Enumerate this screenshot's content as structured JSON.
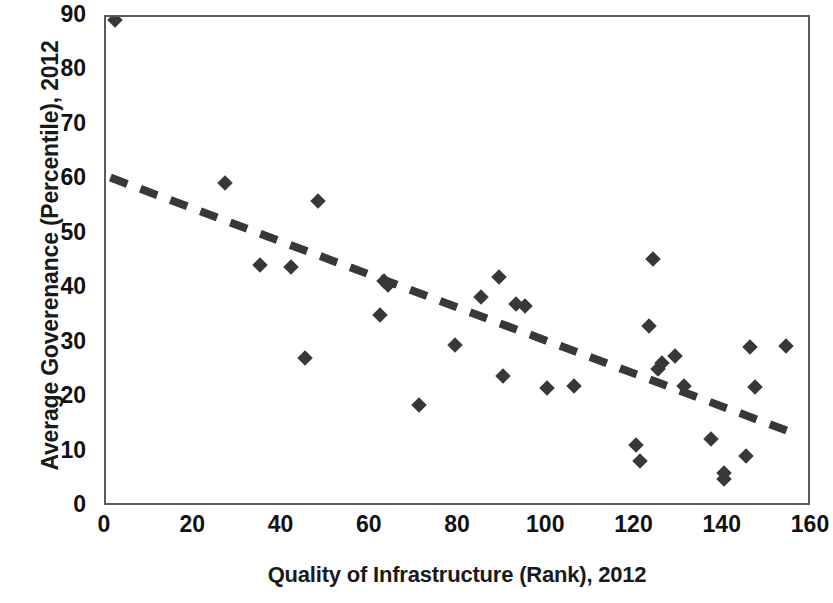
{
  "chart_data": {
    "type": "scatter",
    "title": "",
    "xlabel": "Quality of Infrastructure (Rank), 2012",
    "ylabel": "Average Goverenance (Percentile), 2012",
    "xlim": [
      0,
      160
    ],
    "ylim": [
      0,
      90
    ],
    "xticks": [
      0,
      20,
      40,
      60,
      80,
      100,
      120,
      140,
      160
    ],
    "yticks": [
      0,
      10,
      20,
      30,
      40,
      50,
      60,
      70,
      80,
      90
    ],
    "grid": false,
    "legend": "none",
    "marker_shape": "diamond",
    "marker_color": "#383838",
    "trendline": {
      "type": "linear",
      "style": "dashed",
      "color": "#383838",
      "width": 8,
      "x_start": 1,
      "y_start": 60.5,
      "x_end": 156,
      "y_end": 13.5
    },
    "points": [
      {
        "x": 2,
        "y": 89.5
      },
      {
        "x": 27,
        "y": 59.5
      },
      {
        "x": 35,
        "y": 44.5
      },
      {
        "x": 42,
        "y": 44
      },
      {
        "x": 45,
        "y": 27.3
      },
      {
        "x": 48,
        "y": 56.2
      },
      {
        "x": 62,
        "y": 35.2
      },
      {
        "x": 63,
        "y": 41.5
      },
      {
        "x": 64,
        "y": 40.8
      },
      {
        "x": 71,
        "y": 18.8
      },
      {
        "x": 79,
        "y": 29.8
      },
      {
        "x": 85,
        "y": 38.5
      },
      {
        "x": 89,
        "y": 42.2
      },
      {
        "x": 90,
        "y": 24
      },
      {
        "x": 93,
        "y": 37.3
      },
      {
        "x": 95,
        "y": 37
      },
      {
        "x": 100,
        "y": 21.8
      },
      {
        "x": 106,
        "y": 22.3
      },
      {
        "x": 120,
        "y": 11.3
      },
      {
        "x": 121,
        "y": 8.5
      },
      {
        "x": 124,
        "y": 45.5
      },
      {
        "x": 123,
        "y": 33.2
      },
      {
        "x": 125,
        "y": 25.3
      },
      {
        "x": 126,
        "y": 26.5
      },
      {
        "x": 129,
        "y": 27.8
      },
      {
        "x": 131,
        "y": 22.3
      },
      {
        "x": 137,
        "y": 12.5
      },
      {
        "x": 140,
        "y": 5.2
      },
      {
        "x": 140,
        "y": 6.3
      },
      {
        "x": 145,
        "y": 9.3
      },
      {
        "x": 146,
        "y": 29.3
      },
      {
        "x": 147,
        "y": 22
      },
      {
        "x": 154,
        "y": 29.5
      }
    ]
  },
  "axis": {
    "y_title": "Average Goverenance (Percentile), 2012",
    "x_title": "Quality of Infrastructure (Rank), 2012",
    "y_tick_labels": [
      "90",
      "80",
      "70",
      "60",
      "50",
      "40",
      "30",
      "20",
      "10",
      "0"
    ],
    "x_tick_labels": [
      "0",
      "20",
      "40",
      "60",
      "80",
      "100",
      "120",
      "140",
      "160"
    ]
  }
}
